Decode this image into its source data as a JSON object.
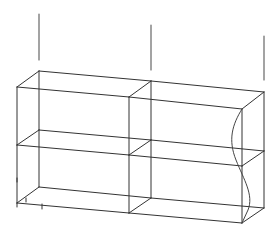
{
  "diagram": {
    "type": "wireframe-3d-box-with-load-arrows",
    "colors": {
      "background": "#ffffff",
      "edge": "#333333",
      "arrow": "#666666",
      "curve": "#444444"
    },
    "vertices": {
      "bl_top": [
        39,
        71
      ],
      "fl_top": [
        17,
        87
      ],
      "bm_top": [
        151,
        81
      ],
      "fm_top": [
        129,
        97
      ],
      "br_top": [
        264,
        92
      ],
      "fr_top": [
        242,
        109
      ],
      "bl_mid": [
        39,
        130
      ],
      "fl_mid": [
        17,
        145
      ],
      "bm_mid": [
        151,
        140
      ],
      "fm_mid": [
        129,
        155
      ],
      "br_mid": [
        264,
        151
      ],
      "fr_mid": [
        242,
        166
      ],
      "bl_bot": [
        39,
        187
      ],
      "fl_bot": [
        17,
        203
      ],
      "bm_bot": [
        151,
        198
      ],
      "fm_bot": [
        129,
        213
      ],
      "br_bot": [
        264,
        208
      ],
      "fr_bot": [
        242,
        223
      ]
    },
    "arrows": [
      {
        "name": "load-arrow-left",
        "x": 39,
        "y1": 14,
        "y2": 60
      },
      {
        "name": "load-arrow-middle",
        "x": 151,
        "y1": 25,
        "y2": 70
      },
      {
        "name": "load-arrow-right",
        "x": 264,
        "y1": 36,
        "y2": 80
      }
    ],
    "deformed_curve": "M242,109 C232,125 228,140 236,160 C244,180 254,195 248,210 L242,223"
  }
}
